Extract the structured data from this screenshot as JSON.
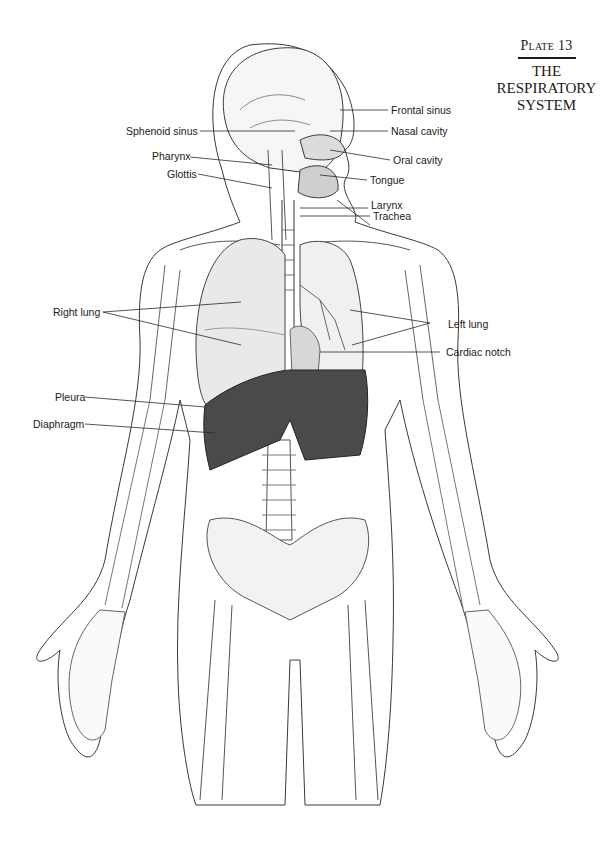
{
  "plate": {
    "number": "Plate 13",
    "title_lines": [
      "THE",
      "RESPIRATORY",
      "SYSTEM"
    ]
  },
  "illustration": {
    "subject": "Human skeleton with respiratory organs, anterior view, head in sagittal section",
    "style": "pencil line drawing, grayscale"
  },
  "labels": {
    "frontal_sinus": "Frontal sinus",
    "sphenoid_sinus": "Sphenoid sinus",
    "nasal_cavity": "Nasal cavity",
    "pharynx": "Pharynx",
    "oral_cavity": "Oral cavity",
    "glottis": "Glottis",
    "tongue": "Tongue",
    "larynx": "Larynx",
    "trachea": "Trachea",
    "right_lung": "Right lung",
    "left_lung": "Left lung",
    "cardiac_notch": "Cardiac notch",
    "pleura": "Pleura",
    "diaphragm": "Diaphragm"
  },
  "colors": {
    "ink": "#1a1a1a",
    "line": "#3a3a3a",
    "shade_light": "#e6e6e6",
    "shade_mid": "#bdbdbd",
    "shade_dark": "#4a4a4a",
    "paper": "#ffffff"
  }
}
